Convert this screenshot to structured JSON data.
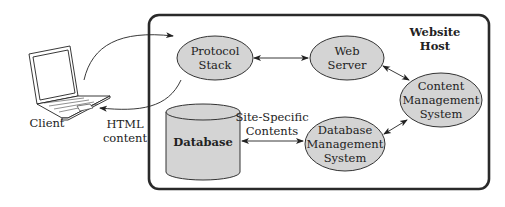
{
  "host": {
    "label_line1": "Website",
    "label_line2": "Host"
  },
  "client": {
    "label": "Client"
  },
  "response": {
    "line1": "HTML",
    "line2": "content"
  },
  "nodes": {
    "protocol_stack": {
      "line1": "Protocol",
      "line2": "Stack"
    },
    "web_server": {
      "line1": "Web",
      "line2": "Server"
    },
    "cms": {
      "line1": "Content",
      "line2": "Management",
      "line3": "System"
    },
    "dbms": {
      "line1": "Database",
      "line2": "Management",
      "line3": "System"
    },
    "database": {
      "label": "Database"
    }
  },
  "edges": {
    "db_dbms_label_line1": "Site-Specific",
    "db_dbms_label_line2": "Contents"
  },
  "colors": {
    "node_fill": "#d4d4d4",
    "stroke": "#333333",
    "background": "#ffffff"
  }
}
